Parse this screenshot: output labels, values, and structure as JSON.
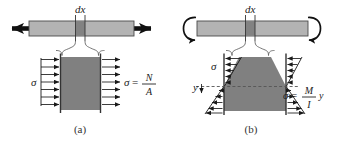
{
  "figure": {
    "panels": [
      {
        "key": "a",
        "caption": "(a)",
        "loading_type": "axial-tension",
        "slice_label": "dx",
        "stress_symbol": "σ",
        "formula": {
          "lhs": "σ",
          "equals": "=",
          "numerator": "N",
          "denominator": "A",
          "trailing": "",
          "full": "σ = N / A"
        },
        "distribution": "uniform",
        "arrow_count": 7,
        "left_arrow_label": "σ",
        "end_arrows": "double-headed axial arrows"
      },
      {
        "key": "b",
        "caption": "(b)",
        "loading_type": "bending-moment",
        "slice_label": "dx",
        "stress_symbol": "σ",
        "axis_label": "y",
        "formula": {
          "lhs": "σ",
          "equals": "=",
          "numerator": "M",
          "denominator": "I",
          "trailing": "y",
          "full": "σ = (M / I) y"
        },
        "distribution": "linear-bending",
        "arrow_count_top": 5,
        "arrow_count_bottom": 5,
        "left_arrow_label": "σ",
        "end_arrows": "curved moment arrows"
      }
    ],
    "colors": {
      "bar_fill": "#b3b3b3",
      "slice_fill": "#828282",
      "block_fill": "#808080",
      "outline": "#333333",
      "arrow": "#1a1a1a",
      "dash": "#555555",
      "background": "#ffffff"
    }
  }
}
